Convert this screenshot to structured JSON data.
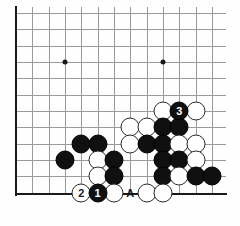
{
  "diagram": {
    "type": "go-board-diagram",
    "board_size": 19,
    "view": "bottom-left-corner",
    "visible_columns": 13,
    "visible_rows": 12,
    "colors": {
      "background": "#ffffff",
      "grid_line": "#9a9a9a",
      "board_edge": "#1a1a1a",
      "black_stone": "#101010",
      "white_stone": "#ffffff",
      "stone_outline": "#2a2a2a",
      "star_point": "#1a1a1a"
    },
    "geometry": {
      "origin_x": 16,
      "origin_y": 13,
      "cell": 16.33,
      "stone_diameter": 19,
      "cols": 13,
      "rows": 12
    },
    "star_points": [
      {
        "col": 3,
        "row": 3
      },
      {
        "col": 9,
        "row": 3
      }
    ],
    "edges": {
      "left": true,
      "bottom": true,
      "top": false,
      "right": false
    },
    "stones": [
      {
        "col": 9,
        "row": 6,
        "color": "white",
        "label": ""
      },
      {
        "col": 11,
        "row": 6,
        "color": "white",
        "label": ""
      },
      {
        "col": 10,
        "row": 6,
        "color": "black",
        "label": "3"
      },
      {
        "col": 7,
        "row": 7,
        "color": "white",
        "label": ""
      },
      {
        "col": 8,
        "row": 7,
        "color": "white",
        "label": ""
      },
      {
        "col": 9,
        "row": 7,
        "color": "black",
        "label": ""
      },
      {
        "col": 10,
        "row": 7,
        "color": "black",
        "label": ""
      },
      {
        "col": 4,
        "row": 8,
        "color": "black",
        "label": ""
      },
      {
        "col": 5,
        "row": 8,
        "color": "black",
        "label": ""
      },
      {
        "col": 7,
        "row": 8,
        "color": "white",
        "label": ""
      },
      {
        "col": 8,
        "row": 8,
        "color": "black",
        "label": ""
      },
      {
        "col": 9,
        "row": 8,
        "color": "black",
        "label": ""
      },
      {
        "col": 10,
        "row": 8,
        "color": "white",
        "label": ""
      },
      {
        "col": 11,
        "row": 8,
        "color": "white",
        "label": ""
      },
      {
        "col": 3,
        "row": 9,
        "color": "black",
        "label": ""
      },
      {
        "col": 5,
        "row": 9,
        "color": "white",
        "label": ""
      },
      {
        "col": 6,
        "row": 9,
        "color": "black",
        "label": ""
      },
      {
        "col": 9,
        "row": 9,
        "color": "black",
        "label": ""
      },
      {
        "col": 10,
        "row": 9,
        "color": "black",
        "label": ""
      },
      {
        "col": 11,
        "row": 9,
        "color": "white",
        "label": ""
      },
      {
        "col": 5,
        "row": 10,
        "color": "white",
        "label": ""
      },
      {
        "col": 6,
        "row": 10,
        "color": "black",
        "label": ""
      },
      {
        "col": 9,
        "row": 10,
        "color": "black",
        "label": ""
      },
      {
        "col": 10,
        "row": 10,
        "color": "white",
        "label": ""
      },
      {
        "col": 11,
        "row": 10,
        "color": "black",
        "label": ""
      },
      {
        "col": 12,
        "row": 10,
        "color": "black",
        "label": ""
      },
      {
        "col": 4,
        "row": 11,
        "color": "white",
        "label": "2"
      },
      {
        "col": 5,
        "row": 11,
        "color": "black",
        "label": "1"
      },
      {
        "col": 6,
        "row": 11,
        "color": "white",
        "label": ""
      },
      {
        "col": 8,
        "row": 11,
        "color": "white",
        "label": ""
      },
      {
        "col": 9,
        "row": 11,
        "color": "white",
        "label": ""
      }
    ],
    "letter_marks": [
      {
        "col": 7,
        "row": 11,
        "text": "A"
      }
    ],
    "move_numbers": {
      "1": "black",
      "2": "white",
      "3": "black"
    }
  }
}
